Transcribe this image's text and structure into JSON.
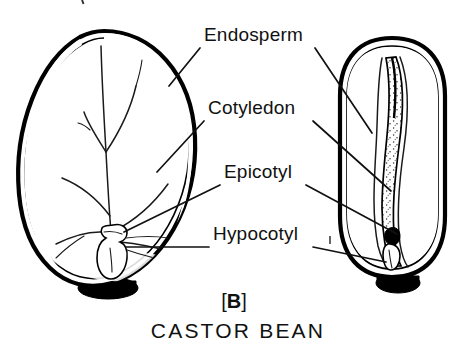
{
  "figure": {
    "caption_bracket_left": "[",
    "caption_letter": "B",
    "caption_bracket_right": "]",
    "caption_title": "CASTOR BEAN",
    "ink_color": "#111111",
    "background_color": "#ffffff"
  },
  "labels": [
    {
      "id": "endosperm",
      "text": "Endosperm",
      "x": 204,
      "y": 41
    },
    {
      "id": "cotyledon",
      "text": "Cotyledon",
      "x": 208,
      "y": 114
    },
    {
      "id": "epicotyl",
      "text": "Epicotyl",
      "x": 224,
      "y": 178
    },
    {
      "id": "hypocotyl",
      "text": "Hypocotyl",
      "x": 213,
      "y": 240
    }
  ],
  "specimens": [
    {
      "id": "face-view",
      "name": "castor-bean-seed-face-view",
      "texture": "fine-crosshatch-stipple",
      "parts": [
        "seed-coat",
        "endosperm",
        "cotyledon-veins",
        "embryo",
        "caruncle"
      ]
    },
    {
      "id": "side-view",
      "name": "castor-bean-seed-side-view",
      "texture": "coarse-random-stipple",
      "parts": [
        "seed-coat",
        "endosperm",
        "embryo-strip",
        "caruncle"
      ]
    }
  ]
}
